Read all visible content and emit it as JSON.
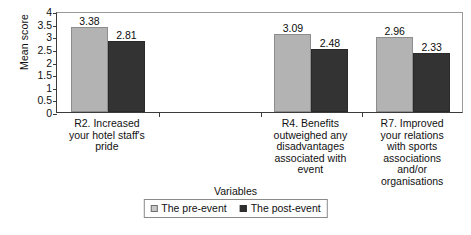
{
  "chart_data": {
    "type": "bar",
    "title": "",
    "xlabel": "Variables",
    "ylabel": "Mean score",
    "ylim": [
      0,
      4
    ],
    "ytick_step": 0.5,
    "yticks": [
      "4",
      "3.5",
      "3",
      "2.5",
      "2",
      "1.5",
      "1",
      "0.5",
      "0"
    ],
    "grid": false,
    "legend_position": "bottom-center",
    "categories": [
      "R2. Increased your hotel staff's pride",
      "R4. Benefits outweighed any disadvantages associated with event",
      "R7. Improved your relations with sports associations and/or organisations"
    ],
    "category_lines": [
      [
        "R2. Increased",
        "your hotel staff's",
        "pride"
      ],
      [
        "R4. Benefits",
        "outweighed any",
        "disadvantages",
        "associated with",
        "event"
      ],
      [
        "R7. Improved",
        "your relations",
        "with sports",
        "associations",
        "and/or",
        "organisations"
      ]
    ],
    "series": [
      {
        "name": "The pre-event",
        "color": "#b3b3b3",
        "values": [
          3.38,
          3.09,
          2.96
        ]
      },
      {
        "name": "The post-event",
        "color": "#333333",
        "values": [
          2.81,
          2.48,
          2.33
        ]
      }
    ],
    "data_labels": [
      [
        "3.38",
        "2.81"
      ],
      [
        "3.09",
        "2.48"
      ],
      [
        "2.96",
        "2.33"
      ]
    ]
  },
  "legend": {
    "items": [
      {
        "label": "The pre-event"
      },
      {
        "label": "The post-event"
      }
    ]
  }
}
